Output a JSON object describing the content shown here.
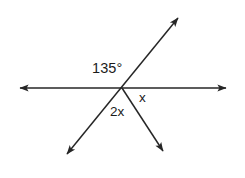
{
  "figure": {
    "type": "geometry-angle-diagram",
    "background_color": "#ffffff",
    "stroke_color": "#262626",
    "text_color": "#1b1b1b",
    "width": 245,
    "height": 178
  },
  "labels": {
    "angle_135": "135°",
    "angle_x": "x",
    "angle_2x": "2x"
  },
  "geometry": {
    "vertex": {
      "x": 122,
      "y": 88
    },
    "lines": [
      {
        "name": "horizontal-line",
        "kind": "double-arrow-line",
        "from": {
          "x": 14,
          "y": 88
        },
        "to": {
          "x": 232,
          "y": 88
        }
      },
      {
        "name": "diagonal-line",
        "kind": "double-arrow-line",
        "from": {
          "x": 62,
          "y": 160
        },
        "to": {
          "x": 183,
          "y": 12
        }
      },
      {
        "name": "lower-right-ray",
        "kind": "single-arrow-ray",
        "from": {
          "x": 122,
          "y": 88
        },
        "to": {
          "x": 167,
          "y": 158
        }
      }
    ]
  }
}
